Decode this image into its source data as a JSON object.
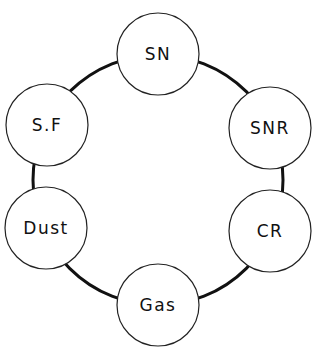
{
  "diagram": {
    "type": "cycle",
    "ring": {
      "cx": 158,
      "cy": 180,
      "r": 125,
      "stroke": "#111111",
      "stroke_width": 3
    },
    "node_style": {
      "r": 41,
      "fill": "#ffffff",
      "stroke": "#222222",
      "stroke_width": 1.2
    },
    "nodes": [
      {
        "id": "sn",
        "label": "SN",
        "cx": 158,
        "cy": 54
      },
      {
        "id": "snr",
        "label": "SNR",
        "cx": 270,
        "cy": 128
      },
      {
        "id": "cr",
        "label": "CR",
        "cx": 270,
        "cy": 231
      },
      {
        "id": "gas",
        "label": "Gas",
        "cx": 158,
        "cy": 305
      },
      {
        "id": "dust",
        "label": "Dust",
        "cx": 46,
        "cy": 228
      },
      {
        "id": "sf",
        "label": "S.F",
        "cx": 47,
        "cy": 125
      }
    ],
    "edges": [
      [
        "SN",
        "SNR"
      ],
      [
        "SNR",
        "CR"
      ],
      [
        "CR",
        "Gas"
      ],
      [
        "Gas",
        "Dust"
      ],
      [
        "Dust",
        "S.F"
      ],
      [
        "S.F",
        "SN"
      ]
    ]
  }
}
